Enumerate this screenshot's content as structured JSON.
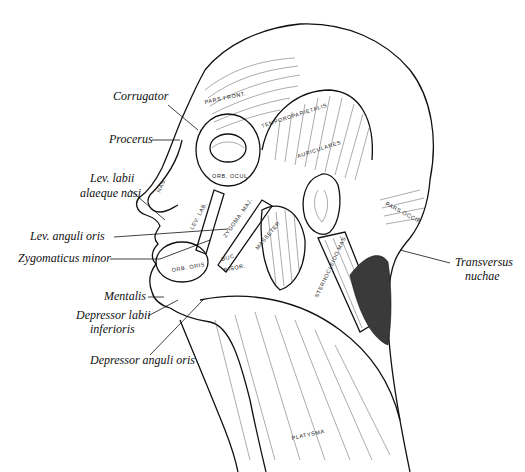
{
  "figure": {
    "colors": {
      "ink": "#111111",
      "background": "#ffffff"
    },
    "labels": [
      {
        "id": "corrugator",
        "lines": [
          "Corrugator"
        ]
      },
      {
        "id": "procerus",
        "lines": [
          "Procerus"
        ]
      },
      {
        "id": "lev-labii",
        "lines": [
          "Lev. labii",
          "alaeque nasi"
        ]
      },
      {
        "id": "lev-anguli",
        "lines": [
          "Lev. anguli oris"
        ]
      },
      {
        "id": "zygomaticus-minor",
        "lines": [
          "Zygomaticus minor"
        ]
      },
      {
        "id": "mentalis",
        "lines": [
          "Mentalis"
        ]
      },
      {
        "id": "depressor-labii",
        "lines": [
          "Depressor labii",
          "inferioris"
        ]
      },
      {
        "id": "depressor-anguli",
        "lines": [
          "Depressor anguli oris"
        ]
      },
      {
        "id": "transversus-nuchae",
        "lines": [
          "Transversus",
          "nuchae"
        ]
      }
    ],
    "muscle_inscriptions": {
      "pars_front": "PARS FRONT.",
      "temporoparietalis": "TEMPOROPARIETALIS",
      "orb_ocul": "ORB. OCUL.",
      "auriculares": "AURICULARES",
      "nas": "NAS.",
      "lev_lab": "LEV. LAB.",
      "zygoma_maj": "ZYGOMA. MAJ.",
      "masseter": "MASSETER",
      "orb_oris": "ORB. ORIS",
      "buc": "BUC.",
      "risor": "RISOR.",
      "pars_occip": "PARS OCCIP.",
      "sternocleido": "STERNOCLEIDO MAS.",
      "platysma": "PLATYSMA"
    }
  }
}
